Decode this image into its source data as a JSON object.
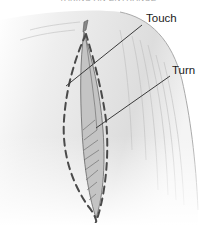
{
  "figure": {
    "caption_cropped": "TAKING AN ENTRANCE",
    "labels": [
      {
        "text": "Touch",
        "points_to": "upper left edge of dashed outline"
      },
      {
        "text": "Turn",
        "points_to": "right side of leaf-shaped cut"
      }
    ],
    "colors": {
      "surface": "#e9e9e9",
      "surface_shadow": "#b8b8b8",
      "dashed_outline": "#555555",
      "leader_line": "#3a3a3a",
      "cut_fill": "#9a9a9a"
    }
  }
}
